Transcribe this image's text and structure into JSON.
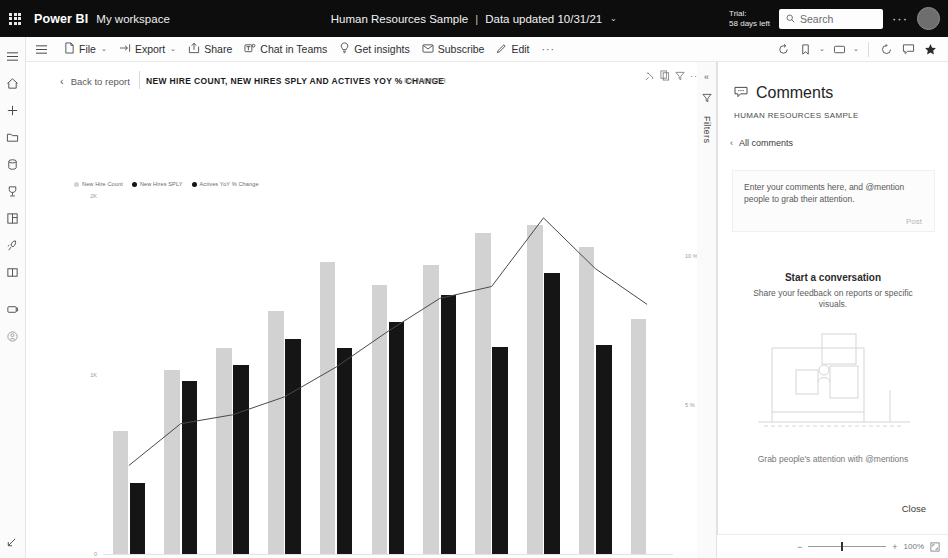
{
  "brandbar": {
    "waffle_name": "app-launcher",
    "product": "Power BI",
    "workspace": "My workspace",
    "report_title": "Human Resources Sample",
    "separator": "|",
    "data_updated": "Data updated 10/31/21",
    "chevron": "⌄",
    "trial_line1": "Trial:",
    "trial_line2": "58 days left",
    "search_placeholder": "Search",
    "overflow": "···"
  },
  "rail": {
    "items": [
      {
        "name": "nav-toggle-icon",
        "label": "Navigation"
      },
      {
        "name": "home-icon",
        "label": "Home"
      },
      {
        "name": "create-plus-icon",
        "label": "Create"
      },
      {
        "name": "browse-folder-icon",
        "label": "Browse"
      },
      {
        "name": "datahub-icon",
        "label": "Data hub"
      },
      {
        "name": "metrics-goals-icon",
        "label": "Metrics"
      },
      {
        "name": "apps-grid-icon",
        "label": "Apps"
      },
      {
        "name": "deployment-pipelines-icon",
        "label": "Deployment pipelines"
      },
      {
        "name": "learn-book-icon",
        "label": "Learn"
      },
      {
        "name": "workspaces-icon",
        "label": "Workspaces"
      },
      {
        "name": "my-workspace-icon",
        "label": "My workspace"
      }
    ]
  },
  "commandbar": {
    "menu_icon": "hamburger-menu-icon",
    "items": [
      {
        "name": "file-menu",
        "label": "File",
        "icon": "file-icon",
        "chevron": "⌄"
      },
      {
        "name": "export-menu",
        "label": "Export",
        "icon": "export-icon",
        "chevron": "⌄"
      },
      {
        "name": "share-button",
        "label": "Share",
        "icon": "share-icon",
        "chevron": ""
      },
      {
        "name": "chat-in-teams-button",
        "label": "Chat in Teams",
        "icon": "teams-icon",
        "chevron": ""
      },
      {
        "name": "get-insights-button",
        "label": "Get insights",
        "icon": "lightbulb-icon",
        "chevron": ""
      },
      {
        "name": "subscribe-button",
        "label": "Subscribe",
        "icon": "mail-icon",
        "chevron": ""
      },
      {
        "name": "edit-button",
        "label": "Edit",
        "icon": "pencil-icon",
        "chevron": ""
      }
    ],
    "overflow": "···",
    "right_icons": [
      {
        "name": "reset-icon",
        "chevron": ""
      },
      {
        "name": "bookmarks-icon",
        "chevron": "⌄"
      },
      {
        "name": "view-icon",
        "chevron": "⌄"
      },
      {
        "name": "refresh-icon",
        "chevron": ""
      },
      {
        "name": "comments-icon",
        "chevron": ""
      },
      {
        "name": "favorite-star-icon",
        "chevron": ""
      }
    ]
  },
  "report": {
    "back_label": "Back to report",
    "back_chevron": "‹",
    "visual_title": "NEW HIRE COUNT, NEW HIRES SPLY AND ACTIVES YOY % CHANGE",
    "visual_subtitle": "BY MONTH",
    "actions": [
      {
        "name": "personalize-visual-icon"
      },
      {
        "name": "copy-visual-icon"
      },
      {
        "name": "filter-visual-icon"
      },
      {
        "name": "more-options-icon"
      }
    ]
  },
  "filters_pane": {
    "collapse_icon": "«",
    "filter_icon": "filter-funnel-icon",
    "label": "Filters"
  },
  "comments": {
    "header_icon": "comment-bubble-icon",
    "title": "Comments",
    "subtitle": "HUMAN RESOURCES SAMPLE",
    "all_comments_chevron": "‹",
    "all_comments_label": "All comments",
    "input_placeholder": "Enter your comments here, and @mention people to grab their attention.",
    "post_label": "Post",
    "empty_title": "Start a conversation",
    "empty_body": "Share your feedback on reports or specific visuals.",
    "illustration_caption": "Grab people's attention with @mentions",
    "close_label": "Close"
  },
  "footer": {
    "zoom_out": "−",
    "zoom_in": "+",
    "zoom_value": "100%",
    "fit_icon": "fit-to-page-icon",
    "corner_icon": "expand-corner-icon"
  },
  "colors": {
    "brand_bar": "#0d0d0d",
    "series_new_hire_count": "#d2d2d2",
    "series_new_hires_sply": "#151515",
    "series_actives_line": "#4a4a4a"
  },
  "chart_data": {
    "type": "bar",
    "title": "New Hire Count, New Hires SPLY and Actives YoY % Change",
    "subtitle": "by Month",
    "xlabel": "",
    "ylabel": "",
    "grid": false,
    "legend_position": "top-left",
    "categories": [
      "Jan",
      "Feb",
      "Mar",
      "Apr",
      "May",
      "Jun",
      "Jul",
      "Aug",
      "Sep",
      "Oct",
      "Nov"
    ],
    "yaxis_left": {
      "ticks": [
        "0",
        "1K",
        "2K"
      ],
      "ylim": [
        0,
        2200
      ]
    },
    "yaxis_right": {
      "ticks": [
        "5 %",
        "10 %"
      ],
      "ylim": [
        0,
        12
      ]
    },
    "series": [
      {
        "name": "New Hire Count",
        "type": "bar",
        "axis": "left",
        "color": "#d2d2d2",
        "values": [
          760,
          1140,
          1270,
          1500,
          1800,
          1660,
          1780,
          1980,
          2030,
          1890,
          1450
        ]
      },
      {
        "name": "New Hires SPLY",
        "type": "bar",
        "axis": "left",
        "color": "#151515",
        "values": [
          440,
          1070,
          1170,
          1330,
          1270,
          1430,
          1600,
          1280,
          1730,
          1290,
          0
        ]
      },
      {
        "name": "Actives YoY % Change",
        "type": "line",
        "axis": "right",
        "color": "#4a4a4a",
        "values": [
          3.0,
          4.4,
          4.7,
          5.3,
          6.3,
          7.5,
          8.6,
          9.0,
          11.3,
          9.6,
          8.4
        ]
      }
    ]
  }
}
